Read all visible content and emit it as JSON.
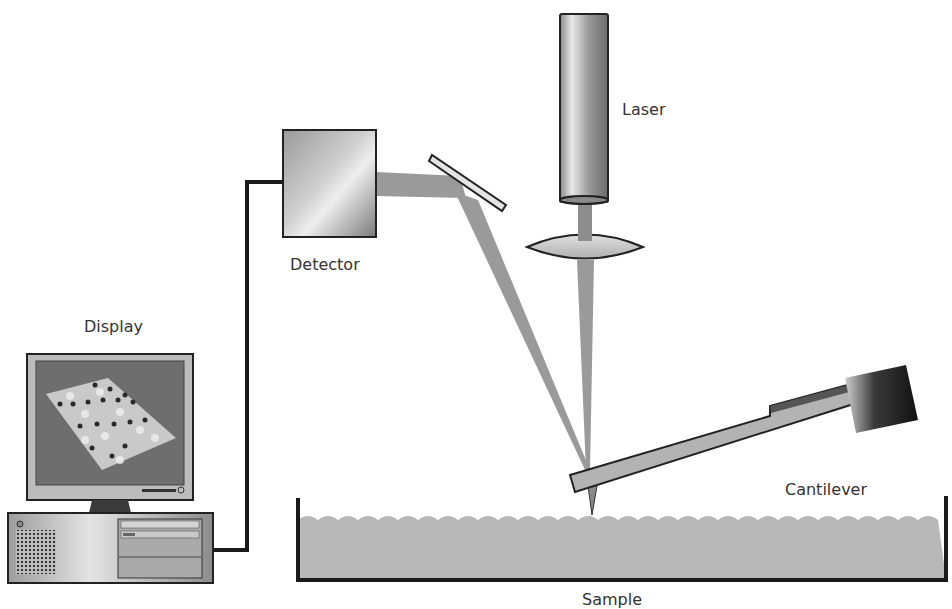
{
  "diagram": {
    "labels": {
      "laser": "Laser",
      "detector": "Detector",
      "display": "Display",
      "cantilever": "Cantilever",
      "sample": "Sample"
    },
    "colors": {
      "beam": "#9a9a9a",
      "sample_fill": "#b8b8b8",
      "outline": "#1a1a1a",
      "screen": "#6e6e6e",
      "cable": "#1a1a1a"
    }
  }
}
